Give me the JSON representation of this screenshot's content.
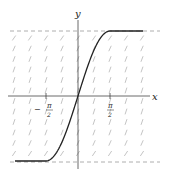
{
  "diagram": {
    "type": "slope-field-with-solution",
    "axes": {
      "x_label": "x",
      "y_label": "y",
      "x_ticks": [
        {
          "value": "-pi/2",
          "sign": "−",
          "num": "π",
          "den": "2"
        },
        {
          "value": "pi/2",
          "sign": "",
          "num": "π",
          "den": "2"
        }
      ]
    },
    "asymptotes": [
      {
        "y": 1,
        "style": "dashed"
      },
      {
        "y": -1,
        "style": "dashed"
      }
    ],
    "curve": {
      "description": "y = -1 for x < -π/2, y = sin x on [-π/2, π/2], y = 1 for x > π/2",
      "color": "#222222"
    },
    "slope_field": {
      "color": "#aaaaaa",
      "rows": 12,
      "cols": 9
    }
  }
}
